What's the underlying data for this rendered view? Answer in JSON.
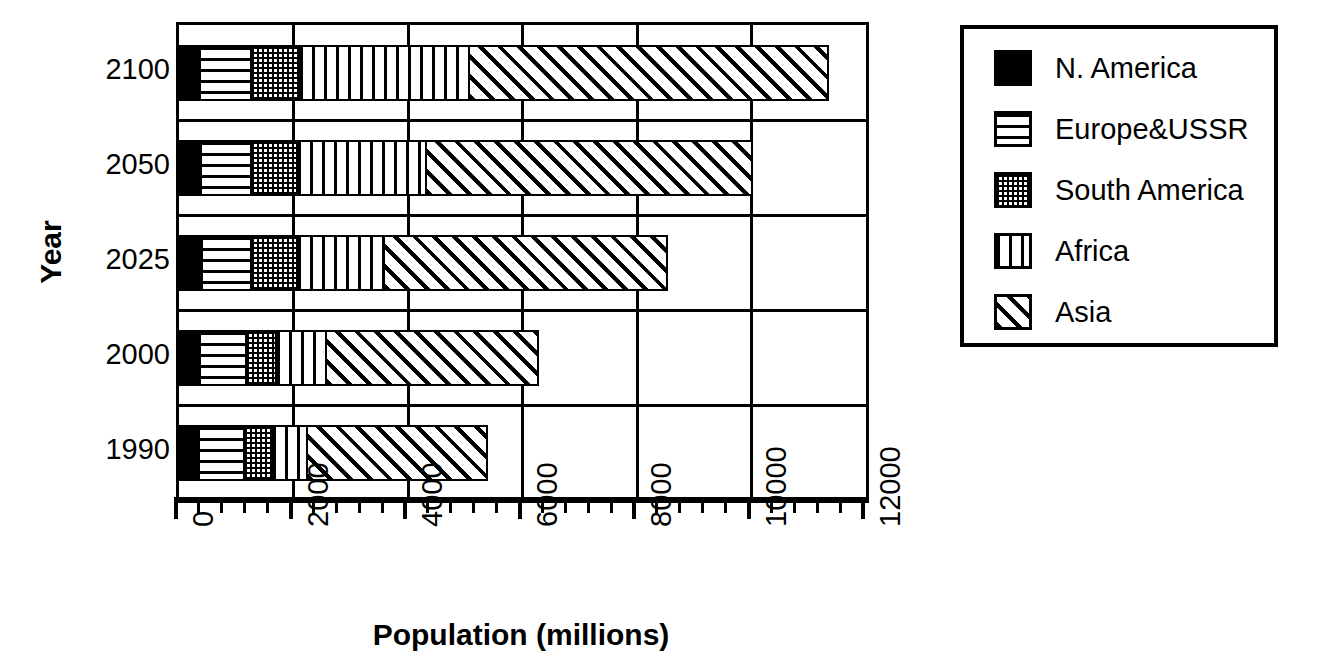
{
  "chart_data": {
    "type": "bar",
    "orientation": "horizontal",
    "stacked": true,
    "title": "",
    "xlabel": "Population (millions)",
    "ylabel": "Year",
    "categories": [
      "1990",
      "2000",
      "2025",
      "2050",
      "2100"
    ],
    "category_order_top_to_bottom": [
      "2100",
      "2050",
      "2025",
      "2000",
      "1990"
    ],
    "xlim": [
      0,
      12000
    ],
    "xticks": [
      0,
      2000,
      4000,
      6000,
      8000,
      10000,
      12000
    ],
    "xtick_labels": [
      "0",
      "2000",
      "4000",
      "6000",
      "8000",
      "10000",
      "12000"
    ],
    "xtick_minor_interval": 400,
    "grid": true,
    "legend_position": "right",
    "series": [
      {
        "name": "N. America",
        "pattern": "solid-black",
        "values": [
          330,
          350,
          380,
          370,
          350
        ]
      },
      {
        "name": "Europe&USSR",
        "pattern": "horizontal-lines",
        "values": [
          790,
          800,
          860,
          870,
          890
        ]
      },
      {
        "name": "South America",
        "pattern": "dotted",
        "values": [
          490,
          530,
          800,
          800,
          840
        ]
      },
      {
        "name": "Africa",
        "pattern": "vertical-lines",
        "values": [
          610,
          870,
          1520,
          2260,
          2970
        ]
      },
      {
        "name": "Asia",
        "pattern": "diagonal-hatch",
        "values": [
          3140,
          3700,
          4950,
          5700,
          6270
        ]
      }
    ],
    "totals": [
      5360,
      6250,
      8510,
      10000,
      11320
    ],
    "annotations": []
  },
  "legend": {
    "items": [
      {
        "label": "N. America",
        "pattern": "solid-black"
      },
      {
        "label": "Europe&USSR",
        "pattern": "horizontal-lines"
      },
      {
        "label": "South America",
        "pattern": "dotted"
      },
      {
        "label": "Africa",
        "pattern": "vertical-lines"
      },
      {
        "label": "Asia",
        "pattern": "diagonal-hatch"
      }
    ]
  },
  "axes": {
    "y_title": "Year",
    "x_title": "Population (millions)"
  },
  "colors": {
    "foreground": "#000000",
    "background": "#ffffff"
  }
}
